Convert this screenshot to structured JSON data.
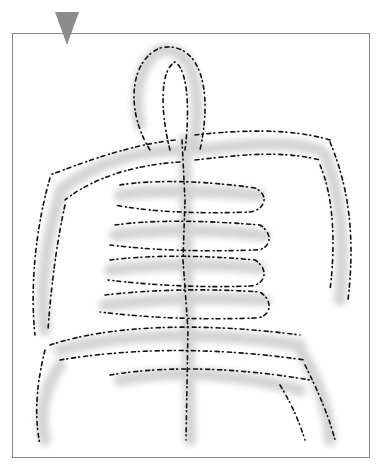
{
  "image": {
    "description": "Hand-drawn ink and gray wash sketch of a branching frond or skeletal form inside a rectangular frame",
    "marker": {
      "shape": "downward-triangle",
      "color": "#8c8c8c"
    },
    "frame": {
      "border_color": "#8a8a8a",
      "background": "#ffffff"
    },
    "colors": {
      "ink": "#111111",
      "wash": "#c9c9c9",
      "wash_dark": "#a8a8a8"
    }
  }
}
